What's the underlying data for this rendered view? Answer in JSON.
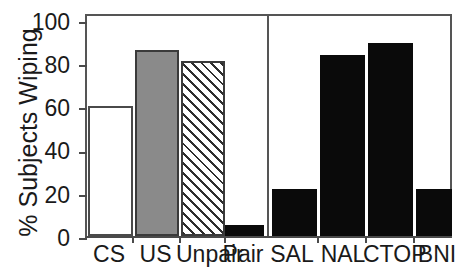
{
  "chart_data": {
    "type": "bar",
    "title": "",
    "xlabel": "",
    "ylabel": "% Subjects Wiping",
    "ylim": [
      0,
      100
    ],
    "yticks": [
      0,
      20,
      40,
      60,
      80,
      100
    ],
    "ytick_labels": [
      "0",
      "20",
      "40",
      "60",
      "80",
      "100"
    ],
    "grid": false,
    "legend": "none",
    "categories": [
      "CS",
      "US",
      "Unpair",
      "Pair",
      "SAL",
      "NAL",
      "CTOP",
      "BNI"
    ],
    "values": [
      58,
      83,
      78,
      5,
      21,
      81,
      86,
      21
    ],
    "bar_styles": [
      "open",
      "gray",
      "hatch",
      "solid",
      "solid",
      "solid",
      "solid",
      "solid"
    ],
    "annotations": [
      {
        "type": "vertical-divider",
        "after_category": "Pair"
      }
    ],
    "groups": [
      {
        "name": "",
        "categories": [
          "CS",
          "US",
          "Unpair",
          "Pair"
        ]
      },
      {
        "name": "",
        "categories": [
          "SAL",
          "NAL",
          "CTOP",
          "BNI"
        ]
      }
    ],
    "colors": {
      "open_fill": "#ffffff",
      "gray_fill": "#8a8a8a",
      "hatch_fill": "#ffffff",
      "hatch_line": "#2e2e2e",
      "solid_fill": "#0a0a0a",
      "outline": "#3a3a3a",
      "axis": "#4a4a4a",
      "text": "#1a1a1a"
    }
  }
}
